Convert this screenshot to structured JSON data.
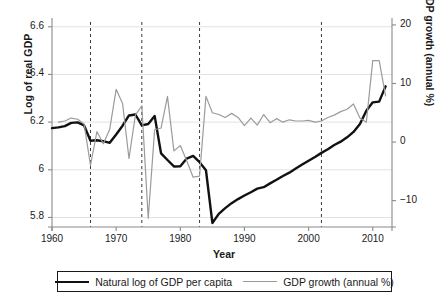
{
  "chart_data": {
    "type": "line",
    "title": "",
    "xlabel": "Year",
    "ylabel": "Log of real GDP",
    "y2label": "GDP growth (annual %)",
    "xlim": [
      1960,
      2013
    ],
    "ylim": [
      5.76,
      6.62
    ],
    "y2lim": [
      -14.5,
      20.5
    ],
    "grid": true,
    "legend_position": "below-center",
    "xticks": [
      1960,
      1970,
      1980,
      1990,
      2000,
      2010
    ],
    "xtick_labels": [
      "1960",
      "1970",
      "1980",
      "1990",
      "2000",
      "2010"
    ],
    "yticks": [
      5.8,
      6.0,
      6.2,
      6.4,
      6.6
    ],
    "ytick_labels": [
      "5.8",
      "6",
      "6.2",
      "6.4",
      "6.6"
    ],
    "y2ticks": [
      -10,
      0,
      10,
      20
    ],
    "y2tick_labels": [
      "-10",
      "0",
      "10",
      "20"
    ],
    "annotations": {
      "vertical_dashed_lines": [
        1966,
        1974,
        1983,
        2002
      ]
    },
    "series": [
      {
        "name": "Natural log of GDP per capita",
        "axis": "left",
        "color": "#111111",
        "width": 2.4,
        "style": "solid",
        "x": [
          1960,
          1961,
          1962,
          1963,
          1964,
          1965,
          1966,
          1967,
          1968,
          1969,
          1970,
          1971,
          1972,
          1973,
          1974,
          1975,
          1976,
          1977,
          1978,
          1979,
          1980,
          1981,
          1982,
          1983,
          1984,
          1985,
          1986,
          1987,
          1988,
          1989,
          1990,
          1991,
          1992,
          1993,
          1994,
          1995,
          1996,
          1997,
          1998,
          1999,
          2000,
          2001,
          2002,
          2003,
          2004,
          2005,
          2006,
          2007,
          2008,
          2009,
          2010,
          2011,
          2012
        ],
        "y": [
          6.175,
          6.178,
          6.183,
          6.197,
          6.199,
          6.186,
          6.122,
          6.124,
          6.12,
          6.113,
          6.148,
          6.185,
          6.228,
          6.232,
          6.186,
          6.192,
          6.226,
          6.069,
          6.041,
          6.014,
          6.015,
          6.047,
          6.058,
          6.032,
          5.998,
          5.777,
          5.815,
          5.839,
          5.86,
          5.877,
          5.892,
          5.906,
          5.921,
          5.927,
          5.943,
          5.958,
          5.974,
          5.988,
          6.005,
          6.022,
          6.038,
          6.054,
          6.071,
          6.086,
          6.104,
          6.118,
          6.136,
          6.159,
          6.192,
          6.248,
          6.283,
          6.286,
          6.35
        ]
      },
      {
        "name": "GDP growth (annual %)",
        "axis": "right",
        "color": "#9b9b9b",
        "width": 1.2,
        "style": "solid",
        "x": [
          1961,
          1962,
          1963,
          1964,
          1965,
          1966,
          1967,
          1968,
          1969,
          1970,
          1971,
          1972,
          1973,
          1974,
          1975,
          1976,
          1977,
          1978,
          1979,
          1980,
          1981,
          1982,
          1983,
          1984,
          1985,
          1986,
          1987,
          1988,
          1989,
          1990,
          1991,
          1992,
          1993,
          1994,
          1995,
          1996,
          1997,
          1998,
          1999,
          2000,
          2001,
          2002,
          2003,
          2004,
          2005,
          2006,
          2007,
          2008,
          2009,
          2010,
          2011,
          2012
        ],
        "y": [
          3.4,
          3.6,
          4.1,
          3.9,
          3.1,
          -4.0,
          1.8,
          -0.3,
          2.2,
          9.0,
          6.6,
          -2.8,
          4.6,
          6.2,
          -13.0,
          2.1,
          2.4,
          7.8,
          -1.5,
          -0.6,
          -3.2,
          -6.0,
          -5.8,
          7.8,
          5.0,
          4.7,
          4.2,
          4.9,
          4.2,
          2.8,
          4.1,
          2.9,
          4.7,
          3.3,
          4.0,
          3.4,
          3.8,
          3.6,
          3.6,
          3.7,
          3.4,
          3.6,
          4.2,
          4.6,
          5.2,
          5.6,
          6.5,
          4.1,
          3.4,
          13.9,
          13.9,
          7.9
        ]
      }
    ]
  },
  "legend": {
    "entries": [
      {
        "label": "Natural log of GDP per capita",
        "swatch": "thick-black-line"
      },
      {
        "label": "GDP growth (annual %)",
        "swatch": "thin-gray-line"
      }
    ]
  },
  "colors": {
    "gdp_line": "#111111",
    "growth_line": "#9b9b9b",
    "gridline": "#e2e2e2",
    "axis": "#8a8a8a",
    "dashed_marker": "#3a3a3a",
    "text": "#1a1a1a",
    "background": "#ffffff"
  }
}
